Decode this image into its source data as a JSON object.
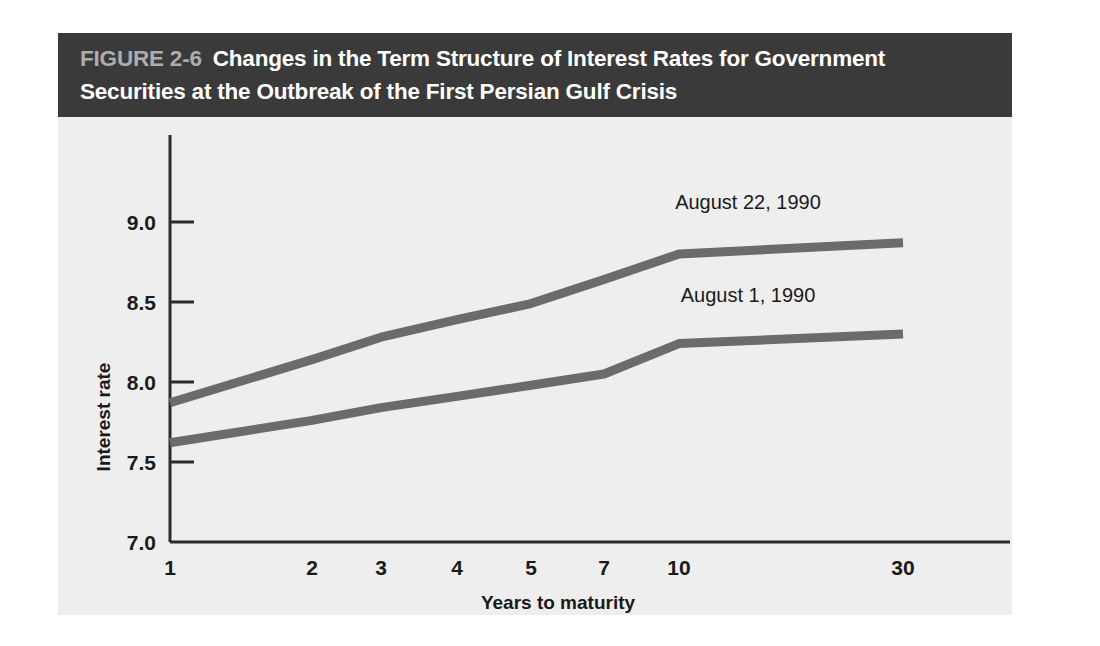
{
  "figure": {
    "number_label": "FIGURE 2-6",
    "title_line_1": "Changes in the Term Structure of Interest Rates for Government",
    "title_line_2": "Securities at the Outbreak of the First Persian Gulf Crisis",
    "banner_color": "#3a3a3a",
    "panel_color": "#eeeeee",
    "number_label_color": "#adadad",
    "title_color": "#ffffff"
  },
  "chart_data": {
    "type": "line",
    "title": "Changes in the Term Structure of Interest Rates for Government Securities at the Outbreak of the First Persian Gulf Crisis",
    "xlabel": "Years to maturity",
    "ylabel": "Interest rate",
    "x": [
      1,
      2,
      3,
      4,
      5,
      7,
      10,
      30
    ],
    "categories": [
      "1",
      "2",
      "3",
      "4",
      "5",
      "7",
      "10",
      "30"
    ],
    "xtick_labels": [
      "1",
      "2",
      "3",
      "4",
      "5",
      "7",
      "10",
      "30"
    ],
    "ytick_labels": [
      "7.0",
      "7.5",
      "8.0",
      "8.5",
      "9.0"
    ],
    "ytick_values": [
      7.0,
      7.5,
      8.0,
      8.5,
      9.0
    ],
    "ylim": [
      7.0,
      9.15
    ],
    "xscale": "ordinal-compressed",
    "grid": false,
    "legend": "inline-annotations",
    "series": [
      {
        "name": "August 22, 1990",
        "color": "#6b6b6b",
        "values": [
          7.87,
          8.14,
          8.28,
          8.39,
          8.49,
          8.64,
          8.8,
          8.87
        ],
        "annotation": "August 22, 1990"
      },
      {
        "name": "August 1, 1990",
        "color": "#6b6b6b",
        "values": [
          7.62,
          7.76,
          7.84,
          7.91,
          7.98,
          8.05,
          8.24,
          8.3
        ],
        "annotation": "August 1, 1990"
      }
    ],
    "annotations": [
      {
        "text": "August 22, 1990",
        "series": "August 22, 1990"
      },
      {
        "text": "August 1, 1990",
        "series": "August 1, 1990"
      }
    ]
  },
  "axes": {
    "y_title": "Interest rate",
    "x_title": "Years to maturity",
    "y_ticks": [
      "9.0",
      "8.5",
      "8.0",
      "7.5",
      "7.0"
    ],
    "x_ticks": [
      "1",
      "2",
      "3",
      "4",
      "5",
      "7",
      "10",
      "30"
    ],
    "axis_color": "#2b2b2b"
  }
}
